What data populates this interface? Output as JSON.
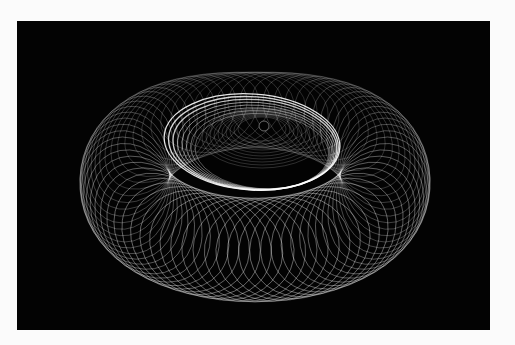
{
  "image": {
    "subject": "light-trail torus of overlapping elliptical loops on black background",
    "background_color": "#030303",
    "frame_color": "#fbfbfb",
    "stroke_color": "#ffffff",
    "torus": {
      "center": [
        255,
        190
      ],
      "outer_radius_x": 185,
      "outer_radius_y": 110,
      "loop_count": 72
    },
    "inner_rings": {
      "center": [
        252,
        142
      ],
      "radius_x": 88,
      "radius_y": 48,
      "count": 8
    },
    "core_hole": {
      "center": [
        264,
        126
      ],
      "radius": 5
    }
  }
}
